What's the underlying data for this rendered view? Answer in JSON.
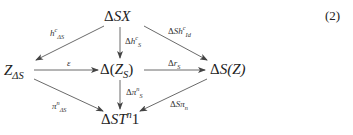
{
  "equation_number": "(2)",
  "nodes": {
    "top": {
      "pre": "Δ",
      "main": "SX"
    },
    "left": {
      "main": "Z",
      "sub": "ΔS"
    },
    "center": {
      "pre": "Δ(",
      "main": "Z",
      "sub": "S",
      "post": ")"
    },
    "right": {
      "pre": "Δ",
      "main": "S",
      "post": "(Z)"
    },
    "bottom": {
      "pre": "Δ",
      "main": "ST",
      "sup": "n",
      "post": "1"
    }
  },
  "edges": [
    {
      "from": "top",
      "to": "left",
      "label": {
        "main": "h",
        "sup": "c",
        "sub": "ΔS"
      }
    },
    {
      "from": "top",
      "to": "center",
      "label": {
        "pre": "Δ",
        "main": "h",
        "sup": "c",
        "sub": "S"
      }
    },
    {
      "from": "top",
      "to": "right",
      "label": {
        "pre": "Δ",
        "main": "Sh",
        "sup": "c",
        "sub": "Id"
      }
    },
    {
      "from": "left",
      "to": "center",
      "label": {
        "main": "ε"
      }
    },
    {
      "from": "center",
      "to": "right",
      "label": {
        "pre": "Δ",
        "main": "r",
        "sub": "S"
      }
    },
    {
      "from": "center",
      "to": "bottom",
      "label": {
        "pre": "Δ",
        "main": "π",
        "sup": "n",
        "sub": "S"
      }
    },
    {
      "from": "left",
      "to": "bottom",
      "label": {
        "main": "π",
        "sup": "n",
        "sub": "ΔS"
      }
    },
    {
      "from": "right",
      "to": "bottom",
      "label": {
        "pre": "Δ",
        "main": "Sπ",
        "sub": "n"
      }
    }
  ],
  "colors": {
    "line": "#444444",
    "text": "#222222"
  }
}
